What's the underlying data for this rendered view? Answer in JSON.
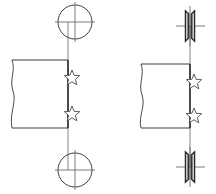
{
  "drawing": {
    "title": "Mechanical Assembly Section Drawing",
    "background_color": "#ffffff",
    "line_color": "#3d3d3d",
    "centerline_color": "#6e6e6e",
    "symbol_color": "#4a4a4a",
    "width": 216,
    "height": 194,
    "views": [
      {
        "id": "left-view",
        "name": "Left View — Plan / Circular Pulley Representation",
        "body": {
          "name": "broken-section-body-left",
          "label": "",
          "x": 12,
          "y": 60,
          "width": 56,
          "height": 68,
          "break_edge": "left"
        },
        "shaft": {
          "name": "vertical-shaft-left",
          "x": 68,
          "y_top": 22,
          "y_bottom": 170
        },
        "end_symbols": [
          {
            "name": "pulley-circle-top-left",
            "type": "circle-with-centermark",
            "cx": 75,
            "cy": 22,
            "r": 17
          },
          {
            "name": "pulley-circle-bottom-left",
            "type": "circle-with-centermark",
            "cx": 75,
            "cy": 170,
            "r": 17
          }
        ],
        "annotations": [
          {
            "name": "star-symbol-upper-left",
            "type": "star-5-point",
            "cx": 72,
            "cy": 77,
            "r": 7
          },
          {
            "name": "star-symbol-lower-left",
            "type": "star-5-point",
            "cx": 72,
            "cy": 113,
            "r": 7
          }
        ]
      },
      {
        "id": "right-view",
        "name": "Right View — Section / Bearing Representation",
        "body": {
          "name": "broken-section-body-right",
          "label": "",
          "x": 141,
          "y": 64,
          "width": 49,
          "height": 64,
          "break_edge": "left"
        },
        "shaft": {
          "name": "vertical-shaft-right",
          "x": 190,
          "y_top": 26,
          "y_bottom": 167
        },
        "end_symbols": [
          {
            "name": "bearing-section-top-right",
            "type": "sectioned-bearing",
            "cx": 190,
            "cy": 26,
            "width": 11,
            "height": 31
          },
          {
            "name": "bearing-section-bottom-right",
            "type": "sectioned-bearing",
            "cx": 190,
            "cy": 167,
            "width": 11,
            "height": 31
          }
        ],
        "annotations": [
          {
            "name": "star-symbol-upper-right",
            "type": "star-5-point",
            "cx": 194,
            "cy": 81,
            "r": 7
          },
          {
            "name": "star-symbol-lower-right",
            "type": "star-5-point",
            "cx": 194,
            "cy": 115,
            "r": 7
          }
        ]
      }
    ]
  }
}
